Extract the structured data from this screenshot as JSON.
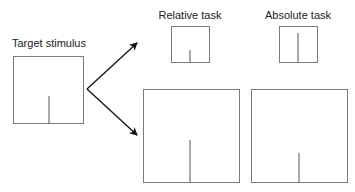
{
  "diagram": {
    "labels": {
      "target": "Target stimulus",
      "relative": "Relative task",
      "absolute": "Absolute task"
    },
    "colors": {
      "frame": "#7a7a7a",
      "line": "#555555",
      "arrow": "#111111",
      "text": "#222222"
    },
    "stimuli": [
      {
        "name": "target",
        "frame": [
          13,
          56,
          70,
          67
        ],
        "line_x": 49,
        "line_top": 96
      },
      {
        "name": "relative-small",
        "frame": [
          171,
          26,
          38,
          36
        ],
        "line_x": 190,
        "line_top": 50
      },
      {
        "name": "absolute-small",
        "frame": [
          279,
          26,
          38,
          36
        ],
        "line_x": 298,
        "line_top": 33
      },
      {
        "name": "relative-large",
        "frame": [
          143,
          89,
          96,
          93
        ],
        "line_x": 190,
        "line_top": 140
      },
      {
        "name": "absolute-large",
        "frame": [
          251,
          89,
          96,
          93
        ],
        "line_x": 299,
        "line_top": 153
      }
    ],
    "arrows": [
      {
        "name": "arrow-to-small",
        "from": [
          87,
          89
        ],
        "to": [
          137,
          43
        ]
      },
      {
        "name": "arrow-to-large",
        "from": [
          87,
          89
        ],
        "to": [
          137,
          135
        ]
      }
    ]
  }
}
